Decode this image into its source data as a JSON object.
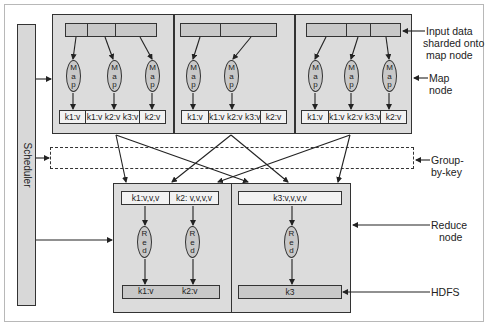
{
  "diagram": {
    "scheduler": {
      "label": "Scheduler"
    },
    "map_nodes": [
      {
        "outputs": [
          "k1:v",
          "k1:v k2:v k3:v",
          "k2:v"
        ],
        "mapper_label": "Map"
      },
      {
        "outputs": [
          "k1:v",
          "k1:v k2:v k3:v",
          "k2:v"
        ],
        "mapper_label": "Map"
      },
      {
        "outputs": [
          "k1:v",
          "k1:v k2:v k3:v",
          "k2:v"
        ],
        "mapper_label": "Map"
      }
    ],
    "reduce_nodes": [
      {
        "inputs": [
          "k1:v,v,v",
          "k2: v,v,v,v"
        ],
        "outputs": [
          "k1:v",
          "k2:v"
        ],
        "reducer_label": "Red"
      },
      {
        "inputs": [
          "k3:v,v,v,v"
        ],
        "outputs": [
          "k3"
        ],
        "reducer_label": "Red"
      }
    ],
    "annotations": {
      "input_data": "Input data sharded onto map node",
      "input_data_lines": [
        "Input data",
        "sharded onto",
        "map node"
      ],
      "map_node": [
        "Map",
        "node"
      ],
      "group_by_key": [
        "Group-",
        "by-key"
      ],
      "reduce_node": [
        "Reduce",
        "node"
      ],
      "hdfs": "HDFS"
    },
    "colors": {
      "node_fill": "#dcdcdc",
      "shard_fill": "#c8c8c8",
      "stroke": "#333333"
    }
  }
}
